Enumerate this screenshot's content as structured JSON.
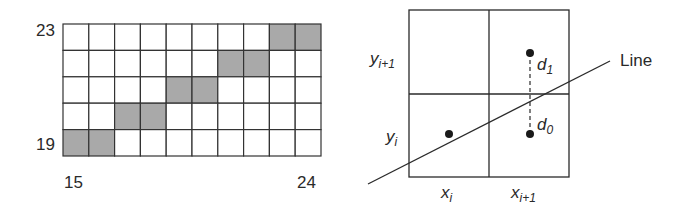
{
  "left_panel": {
    "title": "Rasterized line on pixel grid",
    "grid": {
      "cols": 10,
      "rows": 5,
      "x_start": 15,
      "x_end": 24,
      "y_bottom": 19,
      "y_top": 23,
      "shaded_cells": [
        {
          "row": 0,
          "cols": [
            8,
            9
          ]
        },
        {
          "row": 1,
          "cols": [
            6,
            7
          ]
        },
        {
          "row": 2,
          "cols": [
            4,
            5
          ]
        },
        {
          "row": 3,
          "cols": [
            2,
            3
          ]
        },
        {
          "row": 4,
          "cols": [
            0,
            1
          ]
        }
      ]
    },
    "labels": {
      "y_top": "23",
      "y_bottom": "19",
      "x_left": "15",
      "x_right": "24"
    },
    "colors": {
      "shade": "#a9a9a9",
      "grid_line": "#333333",
      "cell": "#ffffff"
    }
  },
  "right_panel": {
    "title": "Bresenham decision between candidate pixels",
    "labels": {
      "y_next": "y",
      "y_next_sub": "i+1",
      "y_cur": "y",
      "y_cur_sub": "i",
      "x_cur": "x",
      "x_cur_sub": "i",
      "x_next": "x",
      "x_next_sub": "i+1",
      "d1": "d",
      "d1_sub": "1",
      "d0": "d",
      "d0_sub": "0",
      "line": "Line"
    },
    "colors": {
      "stroke": "#2a2a2a",
      "dot": "#1a1a1a"
    }
  }
}
